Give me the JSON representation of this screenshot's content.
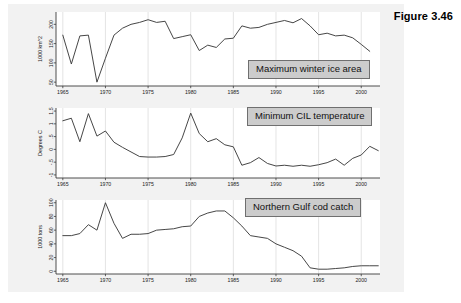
{
  "figure": {
    "title": "Figure 3.46"
  },
  "callouts": {
    "ice": "Maximum winter ice area",
    "cil": "Minimum CIL temperature",
    "cod": "Northern Gulf cod catch"
  },
  "colors": {
    "page_background": "#ffffff",
    "figure_background": "#f2f2f2",
    "plot_background": "#ffffff",
    "line": "#3c3c3c",
    "axis": "#3a3a3a",
    "gridline": "#d8d8d8",
    "callout_fill": "#cccccc",
    "callout_border": "#6f6f6f",
    "text": "#111111"
  },
  "chart_data": [
    {
      "type": "line",
      "title": "Maximum winter ice area",
      "xlabel": "",
      "ylabel": "1000 km^2",
      "xlim": [
        1964.2,
        2002.2
      ],
      "ylim": [
        40,
        232
      ],
      "xticks": [
        1965,
        1970,
        1975,
        1980,
        1985,
        1990,
        1995,
        2000
      ],
      "yticks": [
        50,
        100,
        150,
        200
      ],
      "xticklabels": [
        "1965",
        "1970",
        "1975",
        "1980",
        "1985",
        "1990",
        "1995",
        "2000"
      ],
      "yticklabels": [
        "50",
        "100",
        "150",
        "200"
      ],
      "grid": true,
      "legend": "none",
      "x": [
        1965,
        1966,
        1967,
        1968,
        1969,
        1970,
        1971,
        1972,
        1973,
        1974,
        1975,
        1976,
        1977,
        1978,
        1979,
        1980,
        1981,
        1982,
        1983,
        1984,
        1985,
        1986,
        1987,
        1988,
        1989,
        1990,
        1991,
        1992,
        1993,
        1994,
        1995,
        1996,
        1997,
        1998,
        1999,
        2000,
        2001
      ],
      "values": [
        172,
        97,
        170,
        172,
        50,
        112,
        172,
        190,
        200,
        205,
        212,
        205,
        208,
        163,
        168,
        173,
        132,
        146,
        140,
        162,
        164,
        196,
        190,
        192,
        200,
        205,
        210,
        204,
        215,
        196,
        173,
        177,
        170,
        172,
        165,
        148,
        130
      ]
    },
    {
      "type": "line",
      "title": "Minimum CIL temperature",
      "xlabel": "",
      "ylabel": "Degrees C",
      "xlim": [
        1964.2,
        2002.2
      ],
      "ylim": [
        -1.12,
        1.62
      ],
      "xticks": [
        1965,
        1970,
        1975,
        1980,
        1985,
        1990,
        1995,
        2000
      ],
      "yticks": [
        -1,
        -0.5,
        0,
        0.5,
        1,
        1.5
      ],
      "xticklabels": [
        "1965",
        "1970",
        "1975",
        "1980",
        "1985",
        "1990",
        "1995",
        "2000"
      ],
      "yticklabels": [
        "-1",
        "-.5",
        "0",
        ".5",
        "1",
        "1.5"
      ],
      "grid": true,
      "legend": "none",
      "x": [
        1965,
        1966,
        1967,
        1968,
        1969,
        1970,
        1971,
        1972,
        1973,
        1974,
        1975,
        1976,
        1977,
        1978,
        1979,
        1980,
        1981,
        1982,
        1983,
        1984,
        1985,
        1986,
        1987,
        1988,
        1989,
        1990,
        1991,
        1992,
        1993,
        1994,
        1995,
        1996,
        1997,
        1998,
        1999,
        2000,
        2001,
        2002
      ],
      "values": [
        1.12,
        1.22,
        0.3,
        1.4,
        0.52,
        0.72,
        0.28,
        0.08,
        -0.1,
        -0.28,
        -0.3,
        -0.3,
        -0.28,
        -0.2,
        0.45,
        1.42,
        0.62,
        0.3,
        0.42,
        0.18,
        0.1,
        -0.62,
        -0.52,
        -0.32,
        -0.55,
        -0.65,
        -0.62,
        -0.66,
        -0.62,
        -0.66,
        -0.6,
        -0.52,
        -0.38,
        -0.62,
        -0.35,
        -0.22,
        0.12,
        -0.05
      ]
    },
    {
      "type": "line",
      "title": "Northern Gulf cod catch",
      "xlabel": "",
      "ylabel": "1000 tons",
      "xlim": [
        1964.2,
        2002.2
      ],
      "ylim": [
        -4,
        104
      ],
      "xticks": [
        1965,
        1970,
        1975,
        1980,
        1985,
        1990,
        1995,
        2000
      ],
      "yticks": [
        0,
        20,
        40,
        60,
        80,
        100
      ],
      "xticklabels": [
        "1965",
        "1970",
        "1975",
        "1980",
        "1985",
        "1990",
        "1995",
        "2000"
      ],
      "yticklabels": [
        "0",
        "20",
        "40",
        "60",
        "80",
        "100"
      ],
      "grid": true,
      "legend": "none",
      "x": [
        1965,
        1966,
        1967,
        1968,
        1969,
        1970,
        1971,
        1972,
        1973,
        1974,
        1975,
        1976,
        1977,
        1978,
        1979,
        1980,
        1981,
        1982,
        1983,
        1984,
        1985,
        1986,
        1987,
        1988,
        1989,
        1990,
        1991,
        1992,
        1993,
        1994,
        1995,
        1996,
        1997,
        1998,
        1999,
        2000,
        2001,
        2002
      ],
      "values": [
        52,
        52,
        55,
        68,
        60,
        100,
        70,
        48,
        54,
        54,
        55,
        60,
        61,
        62,
        65,
        66,
        80,
        85,
        88,
        88,
        78,
        66,
        52,
        50,
        48,
        40,
        35,
        30,
        22,
        5,
        3,
        3,
        4,
        5,
        7,
        8,
        8,
        8
      ]
    }
  ]
}
